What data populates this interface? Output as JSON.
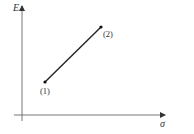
{
  "diagram": {
    "type": "line-plot-sketch",
    "axes": {
      "y_label": "E",
      "x_label": "σ",
      "origin": {
        "x": 22,
        "y": 115
      },
      "y_axis_top": 5,
      "y_axis_bottom": 121,
      "x_axis_left": 14,
      "x_axis_right": 166
    },
    "points": [
      {
        "label": "(1)",
        "x": 45,
        "y": 82
      },
      {
        "label": "(2)",
        "x": 101,
        "y": 27
      }
    ],
    "colors": {
      "axis": "#777777",
      "line": "#222222",
      "text": "#333333"
    }
  }
}
